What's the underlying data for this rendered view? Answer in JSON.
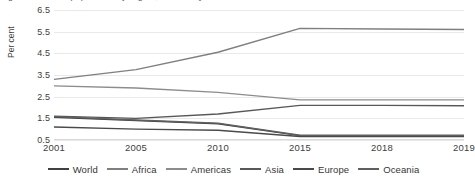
{
  "title_sliver": "Figure: Share of population by region, selected years",
  "chart_data": {
    "type": "line",
    "title": "",
    "subtitle": "",
    "xlabel": "",
    "ylabel": "Per cent",
    "categories": [
      "2001",
      "2005",
      "2010",
      "2015",
      "2018",
      "2019"
    ],
    "ylim": [
      0.5,
      6.5
    ],
    "yticks": [
      "6.5",
      "5.5",
      "4.5",
      "3.5",
      "2.5",
      "1.5",
      "0.5"
    ],
    "ytick_values": [
      6.5,
      5.5,
      4.5,
      3.5,
      2.5,
      1.5,
      0.5
    ],
    "grid": true,
    "legend_position": "bottom",
    "series": [
      {
        "name": "World",
        "color": "#404040",
        "values": [
          1.55,
          1.4,
          1.25,
          0.7,
          0.7,
          0.7
        ]
      },
      {
        "name": "Africa",
        "color": "#7f7f7f",
        "values": [
          3.3,
          3.75,
          4.55,
          5.65,
          5.62,
          5.6
        ]
      },
      {
        "name": "Americas",
        "color": "#8c8c8c",
        "values": [
          3.0,
          2.9,
          2.7,
          2.35,
          2.35,
          2.35
        ]
      },
      {
        "name": "Asia",
        "color": "#585858",
        "values": [
          1.6,
          1.5,
          1.7,
          2.1,
          2.1,
          2.08
        ]
      },
      {
        "name": "Europe",
        "color": "#4a4a4a",
        "values": [
          1.1,
          1.0,
          0.95,
          0.66,
          0.66,
          0.66
        ]
      },
      {
        "name": "Oceania",
        "color": "#5f5f5f",
        "values": [
          1.58,
          1.42,
          1.27,
          0.72,
          0.72,
          0.72
        ]
      }
    ]
  }
}
